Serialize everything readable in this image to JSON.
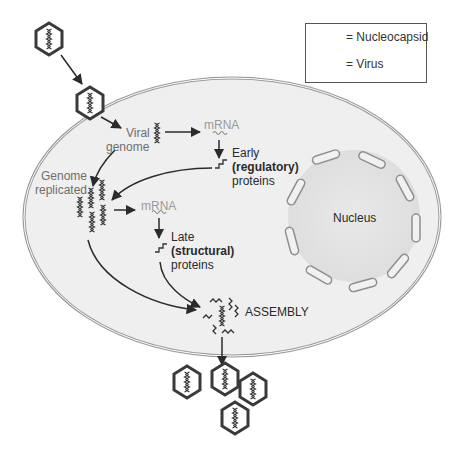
{
  "legend": {
    "nucleocapsid_label": "= Nucleocapsid",
    "virus_label": "= Virus"
  },
  "labels": {
    "viral": "Viral",
    "genome": "genome",
    "mrna_1": "mRNA",
    "early": "Early",
    "regulatory": "(regulatory)",
    "proteins_1": "proteins",
    "genome_rep_1": "Genome",
    "genome_rep_2": "replicated",
    "mrna_2": "mRNA",
    "late": "Late",
    "structural": "(structural)",
    "proteins_2": "proteins",
    "assembly": "ASSEMBLY",
    "nucleus": "Nucleus"
  },
  "colors": {
    "cell_fill": "#efefef",
    "cell_border": "#9a9a9a",
    "nucleus_fill": "#e4e4e4",
    "stroke_dark": "#2b2b2b",
    "text_grey": "#6e6e6e",
    "mrna_grey": "#9a9a9a"
  },
  "icons": {
    "virus": "hexagon-with-helix",
    "nucleocapsid": "double-helix",
    "mrna": "wavy-line",
    "protein": "zigzag-line"
  }
}
